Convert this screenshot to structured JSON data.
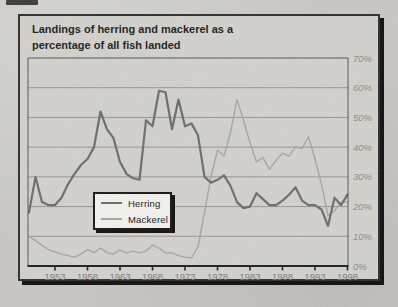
{
  "figure": {
    "title_line1": "Landings of herring and mackerel as a",
    "title_line2": "percentage of all fish landed"
  },
  "legend": {
    "items": [
      {
        "label": "Herring",
        "color": "#6d6c6a",
        "stroke_width": 2.2
      },
      {
        "label": "Mackerel",
        "color": "#a7a5a1",
        "stroke_width": 1.4
      }
    ]
  },
  "colors": {
    "page_bg": "#c9c7c2",
    "card_bg": "#d3d1cc",
    "card_border": "#2f2d2b",
    "shadow": "#0e0d0c",
    "plot_border": "#56544f",
    "gridline": "#97958f",
    "axis": "#1f1e1c",
    "ytick_text": "#8e8c86",
    "xtick_text": "#7c7a74",
    "title_text": "#1b1a19",
    "legend_bg": "#f3f2ee"
  },
  "chart_data": {
    "type": "line",
    "title": "Landings of herring and mackerel as a percentage of all fish landed",
    "xlabel": "",
    "ylabel": "",
    "ylabel_side": "right",
    "grid": "horizontal",
    "legend_position": "inside-bottom-left",
    "ylim": [
      0,
      70
    ],
    "xlim": [
      1948.8,
      1998.2
    ],
    "ytick_values": [
      0,
      10,
      20,
      30,
      40,
      50,
      60,
      70
    ],
    "ytick_labels": [
      "0%",
      "10%",
      "20%",
      "30%",
      "40%",
      "50%",
      "60%",
      "70%"
    ],
    "xtick_values": [
      1953,
      1958,
      1963,
      1968,
      1973,
      1978,
      1983,
      1988,
      1993,
      1998
    ],
    "xtick_labels": [
      "1953",
      "1958",
      "1963",
      "1968",
      "1973",
      "1978",
      "1983",
      "1988",
      "1993",
      "1998"
    ],
    "x": [
      1949,
      1950,
      1951,
      1952,
      1953,
      1954,
      1955,
      1956,
      1957,
      1958,
      1959,
      1960,
      1961,
      1962,
      1963,
      1964,
      1965,
      1966,
      1967,
      1968,
      1969,
      1970,
      1971,
      1972,
      1973,
      1974,
      1975,
      1976,
      1977,
      1978,
      1979,
      1980,
      1981,
      1982,
      1983,
      1984,
      1985,
      1986,
      1987,
      1988,
      1989,
      1990,
      1991,
      1992,
      1993,
      1994,
      1995,
      1996,
      1997,
      1998
    ],
    "series": [
      {
        "name": "Herring",
        "values": [
          18,
          30,
          21.5,
          20.5,
          20.5,
          23,
          27.5,
          31,
          34,
          36,
          40,
          52,
          46,
          43,
          35,
          31,
          29.5,
          29,
          49,
          47,
          59,
          58.5,
          46,
          56,
          47,
          48,
          44,
          30,
          28,
          29,
          30.5,
          27,
          21.5,
          19.5,
          20,
          24.5,
          22.5,
          20.5,
          20.5,
          22,
          24,
          26.5,
          22,
          20.5,
          20.5,
          19,
          13.5,
          23,
          20.5,
          24
        ]
      },
      {
        "name": "Mackerel",
        "values": [
          10,
          8.5,
          7,
          5.5,
          4.7,
          4,
          3.5,
          3,
          4,
          5.5,
          4.5,
          6,
          4.5,
          4,
          5.4,
          4.4,
          5,
          4.4,
          5,
          7,
          6,
          4.4,
          4.4,
          3.5,
          3,
          2.7,
          6.4,
          18,
          30,
          39,
          37,
          45,
          56,
          49,
          41.5,
          35,
          36.5,
          32.5,
          35.5,
          38,
          37,
          40,
          39.5,
          43.5,
          36,
          27.5,
          17,
          18.5,
          21.5,
          21.5
        ]
      }
    ]
  }
}
